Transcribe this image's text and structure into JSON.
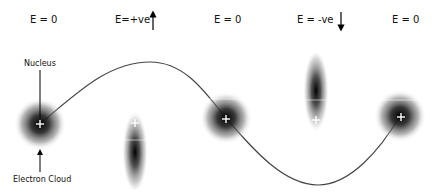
{
  "field_labels": [
    {
      "text": "E = 0",
      "x": 30
    },
    {
      "text": "E=+ve",
      "x": 115
    },
    {
      "text": "E = 0",
      "x": 214
    },
    {
      "text": "E = -ve",
      "x": 297
    },
    {
      "text": "E = 0",
      "x": 392
    }
  ],
  "annotations": {
    "nucleus": "Nucleus",
    "electron_cloud": "Electron Cloud"
  },
  "states": [
    {
      "field": "E = 0",
      "cloud": "spherical",
      "cx": 40,
      "cy": 124
    },
    {
      "field": "E=+ve",
      "cloud": "elongated-down",
      "cx": 135,
      "cy": 148
    },
    {
      "field": "E = 0",
      "cloud": "spherical",
      "cx": 226,
      "cy": 118
    },
    {
      "field": "E = -ve",
      "cloud": "elongated-up",
      "cx": 316,
      "cy": 94
    },
    {
      "field": "E = 0",
      "cloud": "spherical",
      "cx": 400,
      "cy": 116
    }
  ]
}
